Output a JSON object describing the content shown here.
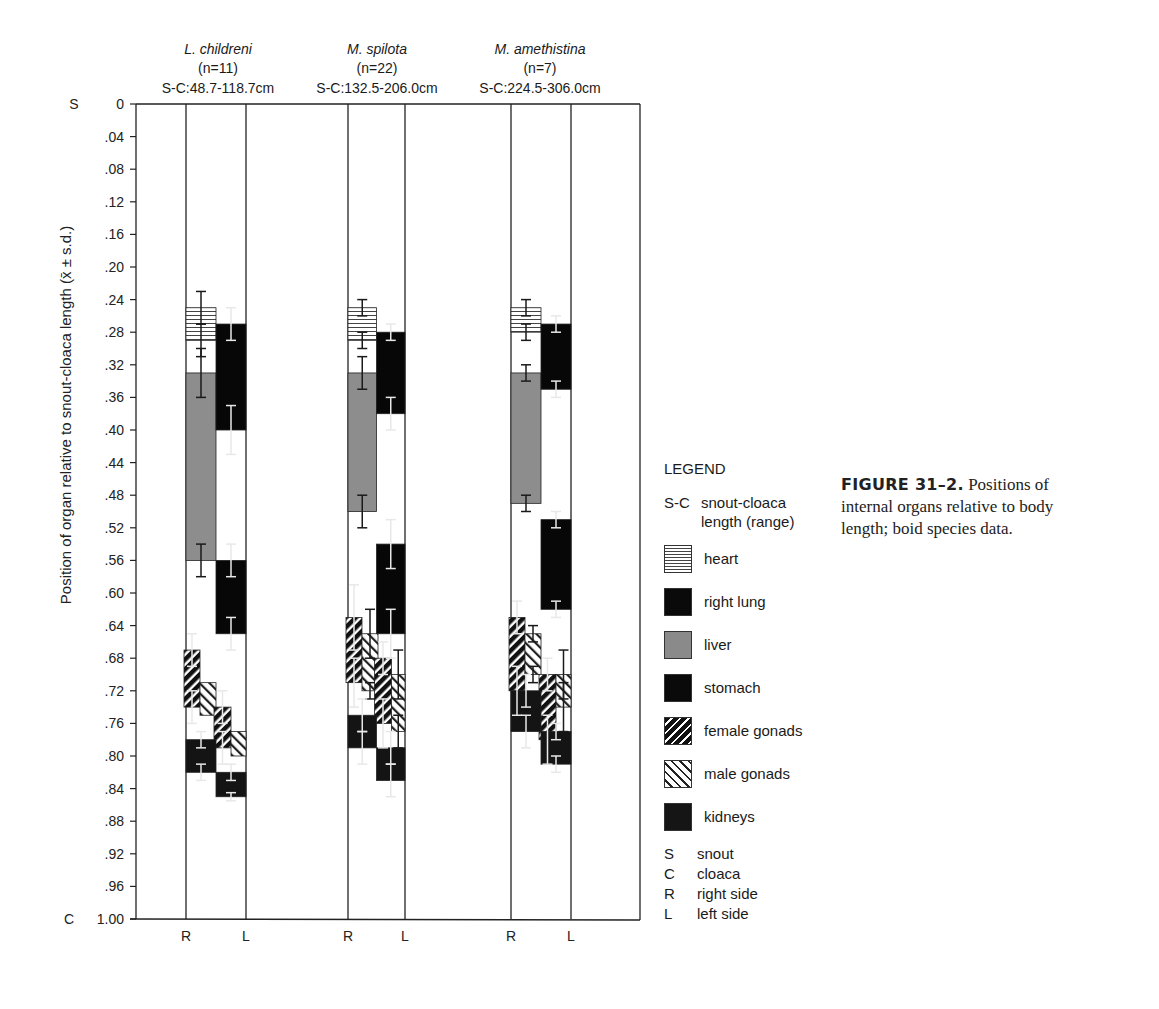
{
  "figure": {
    "caption_label": "FIGURE 31–2.",
    "caption_text": " Positions of internal organs relative to body length; boid species data."
  },
  "legend": {
    "title": "LEGEND",
    "sc_abbr": "S-C",
    "sc_desc": "snout-cloaca length (range)",
    "items": [
      {
        "key": "heart",
        "label": "heart",
        "swatch": "sw-heart"
      },
      {
        "key": "right_lung",
        "label": "right lung",
        "swatch": "sw-black"
      },
      {
        "key": "liver",
        "label": "liver",
        "swatch": "sw-liver"
      },
      {
        "key": "stomach",
        "label": "stomach",
        "swatch": "sw-black"
      },
      {
        "key": "female_gonads",
        "label": "female gonads",
        "swatch": "sw-female"
      },
      {
        "key": "male_gonads",
        "label": "male gonads",
        "swatch": "sw-male"
      },
      {
        "key": "kidneys",
        "label": "kidneys",
        "swatch": "sw-kidney"
      }
    ],
    "definitions": [
      {
        "abbr": "S",
        "text": "snout"
      },
      {
        "abbr": "C",
        "text": "cloaca"
      },
      {
        "abbr": "R",
        "text": "right side"
      },
      {
        "abbr": "L",
        "text": "left side"
      }
    ]
  },
  "chart_data": {
    "type": "bar",
    "subtype": "floating-range-bars-with-error-bars",
    "title": "",
    "ylabel": "Position of organ relative to snout-cloaca length (x̄ ± s.d.)",
    "xlabel": "",
    "ylim": [
      0,
      1.0
    ],
    "y_inverted": true,
    "y_top_label": "S",
    "y_bottom_label": "C",
    "y_ticks": [
      "0",
      ".04",
      ".08",
      ".12",
      ".16",
      ".20",
      ".24",
      ".28",
      ".32",
      ".36",
      ".40",
      ".44",
      ".48",
      ".52",
      ".56",
      ".60",
      ".64",
      ".68",
      ".72",
      ".76",
      ".80",
      ".84",
      ".88",
      ".92",
      ".96",
      "1.00"
    ],
    "grid": false,
    "legend_position": "right",
    "groups": [
      {
        "species": "L. childreni",
        "n": "(n=11)",
        "sc_range": "S-C:48.7-118.7cm",
        "side_labels": [
          "R",
          "L"
        ],
        "organs": [
          {
            "organ": "heart",
            "side": "R",
            "start": 0.25,
            "end": 0.29,
            "sd_start": 0.02,
            "sd_end": 0.02
          },
          {
            "organ": "liver",
            "side": "R",
            "start": 0.33,
            "end": 0.56,
            "sd_start": 0.03,
            "sd_end": 0.02
          },
          {
            "organ": "right_lung",
            "side": "L",
            "start": 0.27,
            "end": 0.4,
            "sd_start": 0.02,
            "sd_end": 0.03
          },
          {
            "organ": "stomach",
            "side": "L",
            "start": 0.56,
            "end": 0.65,
            "sd_start": 0.02,
            "sd_end": 0.02
          },
          {
            "organ": "female_gonads",
            "side": "R",
            "start": 0.67,
            "end": 0.74,
            "sd_start": 0.02,
            "sd_end": 0.02
          },
          {
            "organ": "male_gonads",
            "side": "R2",
            "start": 0.71,
            "end": 0.75,
            "sd_start": 0,
            "sd_end": 0
          },
          {
            "organ": "female_gonads",
            "side": "L",
            "start": 0.74,
            "end": 0.79,
            "sd_start": 0.02,
            "sd_end": 0.02
          },
          {
            "organ": "male_gonads",
            "side": "L2",
            "start": 0.77,
            "end": 0.8,
            "sd_start": 0,
            "sd_end": 0
          },
          {
            "organ": "kidneys",
            "side": "R",
            "start": 0.78,
            "end": 0.82,
            "sd_start": 0.01,
            "sd_end": 0.01
          },
          {
            "organ": "kidneys",
            "side": "L",
            "start": 0.82,
            "end": 0.85,
            "sd_start": 0.01,
            "sd_end": 0.005
          }
        ]
      },
      {
        "species": "M. spilota",
        "n": "(n=22)",
        "sc_range": "S-C:132.5-206.0cm",
        "side_labels": [
          "R",
          "L"
        ],
        "organs": [
          {
            "organ": "heart",
            "side": "R",
            "start": 0.25,
            "end": 0.29,
            "sd_start": 0.01,
            "sd_end": 0.01
          },
          {
            "organ": "liver",
            "side": "R",
            "start": 0.33,
            "end": 0.5,
            "sd_start": 0.02,
            "sd_end": 0.02
          },
          {
            "organ": "right_lung",
            "side": "L",
            "start": 0.28,
            "end": 0.38,
            "sd_start": 0.01,
            "sd_end": 0.02
          },
          {
            "organ": "stomach",
            "side": "L",
            "start": 0.54,
            "end": 0.65,
            "sd_start": 0.03,
            "sd_end": 0.03
          },
          {
            "organ": "female_gonads",
            "side": "R",
            "start": 0.63,
            "end": 0.71,
            "sd_start": 0.04,
            "sd_end": 0.03
          },
          {
            "organ": "male_gonads",
            "side": "R2",
            "start": 0.65,
            "end": 0.72,
            "sd_start": 0.03,
            "sd_end": 0.01
          },
          {
            "organ": "female_gonads",
            "side": "L",
            "start": 0.68,
            "end": 0.76,
            "sd_start": 0.02,
            "sd_end": 0.03
          },
          {
            "organ": "male_gonads",
            "side": "L2",
            "start": 0.7,
            "end": 0.77,
            "sd_start": 0.03,
            "sd_end": 0.02
          },
          {
            "organ": "kidneys",
            "side": "R",
            "start": 0.75,
            "end": 0.79,
            "sd_start": 0.02,
            "sd_end": 0.02
          },
          {
            "organ": "kidneys",
            "side": "L",
            "start": 0.79,
            "end": 0.83,
            "sd_start": 0.02,
            "sd_end": 0.02
          }
        ]
      },
      {
        "species": "M. amethistina",
        "n": "(n=7)",
        "sc_range": "S-C:224.5-306.0cm",
        "side_labels": [
          "R",
          "L"
        ],
        "organs": [
          {
            "organ": "heart",
            "side": "R",
            "start": 0.25,
            "end": 0.28,
            "sd_start": 0.01,
            "sd_end": 0.01
          },
          {
            "organ": "liver",
            "side": "R",
            "start": 0.33,
            "end": 0.49,
            "sd_start": 0.01,
            "sd_end": 0.01
          },
          {
            "organ": "right_lung",
            "side": "L",
            "start": 0.27,
            "end": 0.35,
            "sd_start": 0.01,
            "sd_end": 0.01
          },
          {
            "organ": "stomach",
            "side": "L",
            "start": 0.51,
            "end": 0.62,
            "sd_start": 0.01,
            "sd_end": 0.01
          },
          {
            "organ": "female_gonads",
            "side": "R",
            "start": 0.63,
            "end": 0.72,
            "sd_start": 0.02,
            "sd_end": 0.03
          },
          {
            "organ": "male_gonads",
            "side": "R2",
            "start": 0.65,
            "end": 0.7,
            "sd_start": 0.01,
            "sd_end": 0.01
          },
          {
            "organ": "female_gonads",
            "side": "L",
            "start": 0.7,
            "end": 0.78,
            "sd_start": 0.02,
            "sd_end": 0.03
          },
          {
            "organ": "male_gonads",
            "side": "L2",
            "start": 0.7,
            "end": 0.74,
            "sd_start": 0.03,
            "sd_end": 0.03
          },
          {
            "organ": "kidneys",
            "side": "R",
            "start": 0.72,
            "end": 0.77,
            "sd_start": 0.02,
            "sd_end": 0.02
          },
          {
            "organ": "kidneys",
            "side": "L",
            "start": 0.77,
            "end": 0.81,
            "sd_start": 0.01,
            "sd_end": 0.01
          }
        ]
      }
    ]
  }
}
